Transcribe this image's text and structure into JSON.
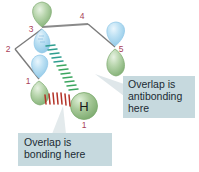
{
  "figure": {
    "kind": "molecular-orbital-diagram",
    "background_color": "#ffffff",
    "orbital_green": "#8fba84",
    "orbital_blue": "#a6d3ec",
    "backbone_color": "#7b7b7b",
    "label_color": "#a8425a",
    "bonding_dash_color": "#b03025",
    "antibonding_dash_color": "#2f9e8f",
    "antibonding_dash_color_2": "#4aa84a",
    "callout_bg": "#c6d9de",
    "callout_text_color": "#1b2b33",
    "pointer_color": "#dde5e8"
  },
  "atom_labels": [
    {
      "id": "label-1-top",
      "text": "1"
    },
    {
      "id": "label-2",
      "text": "2"
    },
    {
      "id": "label-3",
      "text": "3"
    },
    {
      "id": "label-4",
      "text": "4"
    },
    {
      "id": "label-5",
      "text": "5"
    },
    {
      "id": "label-1-bottom",
      "text": "1"
    }
  ],
  "hydrogen": {
    "symbol": "H",
    "label": "1"
  },
  "callouts": [
    {
      "id": "antibonding",
      "lines": [
        "Overlap is",
        "antibonding",
        "here"
      ]
    },
    {
      "id": "bonding",
      "lines": [
        "Overlap is",
        "bonding here"
      ]
    }
  ],
  "orbitals": [
    {
      "id": "orbital-3",
      "upper_lobe": "green",
      "lower_lobe": "blue",
      "number": "3"
    },
    {
      "id": "orbital-4",
      "upper_lobe": "blue",
      "lower_lobe": "none",
      "number": "4"
    },
    {
      "id": "orbital-5",
      "upper_lobe": "blue",
      "lower_lobe": "green",
      "number": "5"
    },
    {
      "id": "orbital-1",
      "upper_lobe": "blue",
      "lower_lobe": "green",
      "number": "1"
    }
  ]
}
